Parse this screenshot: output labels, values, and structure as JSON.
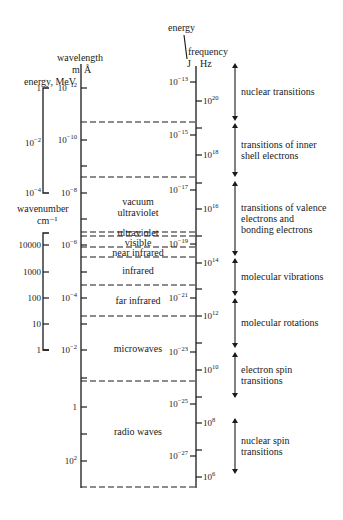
{
  "axes": {
    "wavelength": {
      "title": "wavelength",
      "units": [
        "m",
        "Å"
      ]
    },
    "energy_mev": {
      "title": "energy, MeV"
    },
    "wavenumber": {
      "title": "wavenumber",
      "units": "cm⁻¹"
    },
    "energy_j": {
      "title": "energy",
      "units": "J"
    },
    "frequency": {
      "title": "frequency",
      "units": "Hz"
    }
  },
  "wavelength_ticks": [
    {
      "base": "10",
      "exp": "−12",
      "y": 88
    },
    {
      "base": "10",
      "exp": "−10",
      "y": 140
    },
    {
      "base": "10",
      "exp": "−8",
      "y": 193
    },
    {
      "base": "10",
      "exp": "−6",
      "y": 245
    },
    {
      "base": "10",
      "exp": "−4",
      "y": 298
    },
    {
      "base": "10",
      "exp": "−2",
      "y": 350
    },
    {
      "base": "1",
      "exp": "",
      "y": 407
    },
    {
      "base": "10",
      "exp": "2",
      "y": 461
    }
  ],
  "wavelength_minor_ticks": [
    166,
    219,
    272,
    324,
    378,
    434
  ],
  "energy_mev_ticks": [
    {
      "base": "1",
      "exp": "",
      "y": 88
    },
    {
      "base": "10",
      "exp": "−2",
      "y": 143
    },
    {
      "base": "10",
      "exp": "−4",
      "y": 193
    }
  ],
  "wavenumber_ticks": [
    {
      "base": "10000",
      "exp": "",
      "y": 245
    },
    {
      "base": "1000",
      "exp": "",
      "y": 272
    },
    {
      "base": "100",
      "exp": "",
      "y": 298
    },
    {
      "base": "10",
      "exp": "",
      "y": 324
    },
    {
      "base": "1",
      "exp": "",
      "y": 350
    }
  ],
  "energy_j_ticks": [
    {
      "base": "10",
      "exp": "−13",
      "y": 82
    },
    {
      "base": "10",
      "exp": "−15",
      "y": 135
    },
    {
      "base": "10",
      "exp": "−17",
      "y": 190
    },
    {
      "base": "10",
      "exp": "−19",
      "y": 244
    },
    {
      "base": "10",
      "exp": "−21",
      "y": 298
    },
    {
      "base": "10",
      "exp": "−23",
      "y": 352
    },
    {
      "base": "10",
      "exp": "−25",
      "y": 404
    },
    {
      "base": "10",
      "exp": "−27",
      "y": 456
    }
  ],
  "frequency_ticks": [
    {
      "base": "10",
      "exp": "20",
      "y": 101
    },
    {
      "base": "10",
      "exp": "18",
      "y": 155
    },
    {
      "base": "10",
      "exp": "16",
      "y": 209
    },
    {
      "base": "10",
      "exp": "14",
      "y": 263
    },
    {
      "base": "10",
      "exp": "12",
      "y": 316
    },
    {
      "base": "10",
      "exp": "10",
      "y": 370
    },
    {
      "base": "10",
      "exp": "8",
      "y": 423
    },
    {
      "base": "10",
      "exp": "6",
      "y": 477
    }
  ],
  "frequency_minor_ticks": [
    128,
    183,
    236,
    289,
    343,
    397,
    450
  ],
  "region_boundaries": [
    122,
    177,
    232,
    236,
    247,
    257,
    285,
    316,
    381,
    487
  ],
  "regions": [
    {
      "label": [
        "vacuum",
        "ultraviolet"
      ],
      "y": 205
    },
    {
      "label": [
        "ultraviolet"
      ],
      "y": 236
    },
    {
      "label": [
        "visible"
      ],
      "y": 246
    },
    {
      "label": [
        "near infrared"
      ],
      "y": 256
    },
    {
      "label": [
        "infrared"
      ],
      "y": 274
    },
    {
      "label": [
        "far infrared"
      ],
      "y": 304
    },
    {
      "label": [
        "microwaves"
      ],
      "y": 352
    },
    {
      "label": [
        "radio waves"
      ],
      "y": 435
    }
  ],
  "transitions": [
    {
      "label": [
        "nuclear transitions"
      ],
      "y1": 63,
      "y2": 121
    },
    {
      "label": [
        "transitions of inner",
        "shell electrons"
      ],
      "y1": 123,
      "y2": 177
    },
    {
      "label": [
        "transitions of valence",
        "electrons and",
        "bonding electrons"
      ],
      "y1": 181,
      "y2": 256
    },
    {
      "label": [
        "molecular vibrations"
      ],
      "y1": 258,
      "y2": 296
    },
    {
      "label": [
        "molecular rotations"
      ],
      "y1": 298,
      "y2": 348
    },
    {
      "label": [
        "electron spin",
        "transitions"
      ],
      "y1": 352,
      "y2": 398
    },
    {
      "label": [
        "nuclear spin",
        "transitions"
      ],
      "y1": 418,
      "y2": 474
    }
  ]
}
